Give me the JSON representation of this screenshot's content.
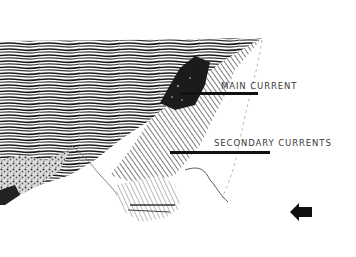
{
  "diagram": {
    "labels": {
      "main_current": "MAIN CURRENT",
      "secondary_currents": "SECONDARY CURRENTS"
    },
    "icons": {
      "direction_arrow": "left-arrow-icon"
    },
    "colors": {
      "ink": "#111111",
      "background": "#ffffff",
      "label_text": "#3a3a3a"
    }
  }
}
